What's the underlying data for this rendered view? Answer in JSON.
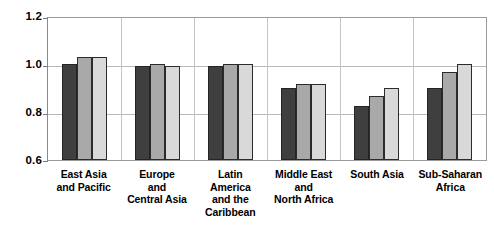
{
  "chart_data": {
    "type": "bar",
    "title": "",
    "subtitle": "",
    "xlabel": "",
    "ylabel": "",
    "ylim": [
      0.6,
      1.2
    ],
    "yticks": [
      "0.6",
      "0.8",
      "1.0",
      "1.2"
    ],
    "ytick_values": [
      0.6,
      0.8,
      1.0,
      1.2
    ],
    "grid": "horizontal-and-group-separators",
    "legend": "none",
    "legend_position": "none",
    "categories": [
      "East Asia and Pacific",
      "Europe and Central Asia",
      "Latin America and the Caribbean",
      "Middle East and North Africa",
      "South Asia",
      "Sub-Saharan Africa"
    ],
    "category_lines": [
      [
        "East Asia",
        "and Pacific"
      ],
      [
        "Europe",
        "and",
        "Central Asia"
      ],
      [
        "Latin",
        "America",
        "and the",
        "Caribbean"
      ],
      [
        "Middle East",
        "and",
        "North Africa"
      ],
      [
        "South Asia"
      ],
      [
        "Sub-Saharan",
        "Africa"
      ]
    ],
    "series": [
      {
        "name": "series-1",
        "color": "#3f3f3f",
        "values": [
          1.0,
          0.99,
          0.99,
          0.9,
          0.825,
          0.9
        ]
      },
      {
        "name": "series-2",
        "color": "#a9a9a9",
        "values": [
          1.03,
          1.0,
          1.0,
          0.915,
          0.865,
          0.965
        ]
      },
      {
        "name": "series-3",
        "color": "#d9d9d9",
        "values": [
          1.03,
          0.99,
          1.0,
          0.915,
          0.9,
          1.0
        ]
      }
    ]
  }
}
